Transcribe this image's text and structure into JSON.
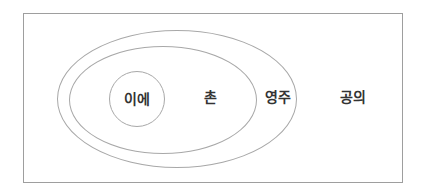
{
  "figure": {
    "type": "nested-sets-diagram",
    "rings": [
      {
        "id": "ie",
        "label": "이에",
        "level": 1,
        "shape": "circle",
        "contained_in": "chon"
      },
      {
        "id": "chon",
        "label": "촌",
        "level": 2,
        "shape": "ellipse",
        "contained_in": "yeongju"
      },
      {
        "id": "yeongju",
        "label": "영주",
        "level": 3,
        "shape": "ellipse",
        "contained_in": "gongui"
      },
      {
        "id": "gongui",
        "label": "공의",
        "level": 4,
        "shape": "rectangle",
        "contained_in": null
      }
    ],
    "colors": {
      "line": "#a8a8a8",
      "frame_line": "#9e9e9e",
      "text": "#333333",
      "background": "#ffffff"
    }
  }
}
